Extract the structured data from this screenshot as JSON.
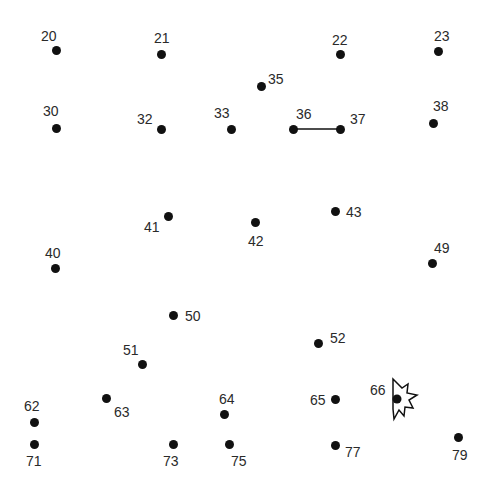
{
  "puzzle": {
    "type": "connect-the-dots",
    "dots": [
      {
        "id": "20",
        "x": 56,
        "y": 50,
        "lx": 41,
        "ly": 29
      },
      {
        "id": "21",
        "x": 161,
        "y": 54,
        "lx": 154,
        "ly": 31
      },
      {
        "id": "22",
        "x": 340,
        "y": 54,
        "lx": 332,
        "ly": 33
      },
      {
        "id": "23",
        "x": 438,
        "y": 51,
        "lx": 434,
        "ly": 29
      },
      {
        "id": "35",
        "x": 261,
        "y": 86,
        "lx": 268,
        "ly": 72
      },
      {
        "id": "30",
        "x": 56,
        "y": 128,
        "lx": 43,
        "ly": 104
      },
      {
        "id": "32",
        "x": 161,
        "y": 129,
        "lx": 137,
        "ly": 112
      },
      {
        "id": "33",
        "x": 231,
        "y": 129,
        "lx": 214,
        "ly": 106
      },
      {
        "id": "36",
        "x": 293,
        "y": 129,
        "lx": 296,
        "ly": 107
      },
      {
        "id": "37",
        "x": 340,
        "y": 129,
        "lx": 350,
        "ly": 112
      },
      {
        "id": "38",
        "x": 433,
        "y": 123,
        "lx": 433,
        "ly": 99
      },
      {
        "id": "41",
        "x": 168,
        "y": 216,
        "lx": 144,
        "ly": 220
      },
      {
        "id": "42",
        "x": 255,
        "y": 222,
        "lx": 248,
        "ly": 234
      },
      {
        "id": "43",
        "x": 335,
        "y": 211,
        "lx": 346,
        "ly": 205
      },
      {
        "id": "40",
        "x": 55,
        "y": 268,
        "lx": 45,
        "ly": 246
      },
      {
        "id": "49",
        "x": 432,
        "y": 263,
        "lx": 434,
        "ly": 241
      },
      {
        "id": "50",
        "x": 173,
        "y": 315,
        "lx": 185,
        "ly": 309
      },
      {
        "id": "52",
        "x": 318,
        "y": 343,
        "lx": 330,
        "ly": 331
      },
      {
        "id": "51",
        "x": 142,
        "y": 364,
        "lx": 123,
        "ly": 343
      },
      {
        "id": "63",
        "x": 106,
        "y": 398,
        "lx": 114,
        "ly": 405
      },
      {
        "id": "62",
        "x": 34,
        "y": 422,
        "lx": 24,
        "ly": 399
      },
      {
        "id": "64",
        "x": 224,
        "y": 414,
        "lx": 219,
        "ly": 392
      },
      {
        "id": "65",
        "x": 335,
        "y": 399,
        "lx": 310,
        "ly": 393
      },
      {
        "id": "66",
        "x": 397,
        "y": 399,
        "lx": 370,
        "ly": 383
      },
      {
        "id": "71",
        "x": 34,
        "y": 444,
        "lx": 26,
        "ly": 454
      },
      {
        "id": "73",
        "x": 173,
        "y": 444,
        "lx": 163,
        "ly": 454
      },
      {
        "id": "75",
        "x": 229,
        "y": 444,
        "lx": 231,
        "ly": 454
      },
      {
        "id": "77",
        "x": 335,
        "y": 445,
        "lx": 345,
        "ly": 445
      },
      {
        "id": "79",
        "x": 458,
        "y": 437,
        "lx": 452,
        "ly": 448
      }
    ],
    "connections": [
      {
        "from": "36",
        "to": "37"
      }
    ],
    "cursor": {
      "name": "starburst-click-cursor",
      "at_dot": "66",
      "stroke": "#111111",
      "fill": "#ffffff"
    },
    "colors": {
      "background": "#ffffff",
      "dot": "#111111",
      "label": "#2a2a2a",
      "line": "#111111"
    }
  }
}
